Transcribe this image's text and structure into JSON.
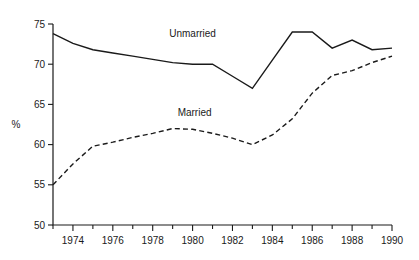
{
  "chart_data": {
    "type": "line",
    "title": "",
    "xlabel": "",
    "ylabel": "%",
    "xlim": [
      1973,
      1990
    ],
    "ylim": [
      50,
      75
    ],
    "grid": false,
    "legend_position": "inline-annotation",
    "y_ticks": [
      50,
      55,
      60,
      65,
      70,
      75
    ],
    "y_tick_labels": [
      "50",
      "55",
      "60",
      "65",
      "70",
      "75"
    ],
    "x_ticks": [
      1973,
      1974,
      1975,
      1976,
      1977,
      1978,
      1979,
      1980,
      1981,
      1982,
      1983,
      1984,
      1985,
      1986,
      1987,
      1988,
      1989,
      1990
    ],
    "x_tick_labels": [
      "1974",
      "1976",
      "1978",
      "1980",
      "1982",
      "1984",
      "1986",
      "1988",
      "1990"
    ],
    "x_labeled_ticks": [
      1974,
      1976,
      1978,
      1980,
      1982,
      1984,
      1986,
      1988,
      1990
    ],
    "x": [
      1973,
      1974,
      1975,
      1976,
      1977,
      1978,
      1979,
      1980,
      1981,
      1982,
      1983,
      1984,
      1985,
      1986,
      1987,
      1988,
      1989,
      1990
    ],
    "series": [
      {
        "name": "Unmarried",
        "style": "solid",
        "color": "#1a1a1a",
        "values": [
          73.8,
          72.6,
          71.8,
          71.4,
          71.0,
          70.6,
          70.2,
          70.0,
          70.0,
          68.5,
          67.0,
          70.5,
          74.0,
          74.0,
          72.0,
          73.0,
          71.8,
          72.0
        ]
      },
      {
        "name": "Married",
        "style": "dashed",
        "color": "#1a1a1a",
        "values": [
          55.0,
          57.6,
          59.8,
          60.3,
          60.9,
          61.4,
          62.0,
          61.9,
          61.4,
          60.8,
          60.0,
          61.2,
          63.2,
          66.4,
          68.6,
          69.2,
          70.2,
          71.0
        ]
      }
    ],
    "annotations": [
      {
        "text": "Unmarried",
        "x": 1980.0,
        "y": 73.4
      },
      {
        "text": "Married",
        "x": 1980.1,
        "y": 63.6
      }
    ]
  }
}
